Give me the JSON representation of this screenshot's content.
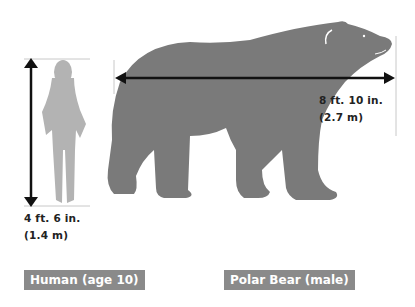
{
  "human": {
    "label": "Human (age 10)",
    "height_ft": "4 ft. 6 in.",
    "height_m": "(1.4 m)"
  },
  "bear": {
    "label": "Polar Bear (male)",
    "length_ft": "8 ft. 10 in.",
    "length_m": "(2.7 m)"
  },
  "colors": {
    "silhouette_human": "#b3b3b3",
    "silhouette_bear": "#7a7a7a",
    "label_bg": "#8a8a8a",
    "arrow": "#111111",
    "guide_line": "#bdbdbd"
  }
}
